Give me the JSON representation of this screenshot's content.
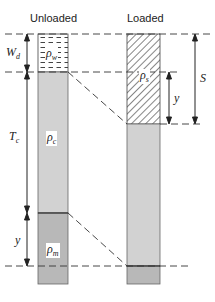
{
  "diagram": {
    "type": "isostasy-column-comparison",
    "columns": [
      {
        "title": "Unloaded",
        "layers": [
          {
            "name": "water",
            "density_label": "ρ",
            "density_sub": "w",
            "fill": "dashed-water"
          },
          {
            "name": "crust",
            "density_label": "ρ",
            "density_sub": "c",
            "fill": "#d2d2d2"
          },
          {
            "name": "mantle",
            "density_label": "ρ",
            "density_sub": "m",
            "fill": "#b8b8b8"
          }
        ]
      },
      {
        "title": "Loaded",
        "layers": [
          {
            "name": "sediment",
            "density_label": "ρ",
            "density_sub": "s",
            "fill": "hatched"
          },
          {
            "name": "crust",
            "fill": "#d2d2d2"
          },
          {
            "name": "mantle",
            "fill": "#b8b8b8"
          }
        ]
      }
    ],
    "dimensions": {
      "water_depth": {
        "symbol": "W",
        "sub": "d"
      },
      "crust_thickness": {
        "symbol": "T",
        "sub": "c"
      },
      "deflection_left": {
        "symbol": "y"
      },
      "deflection_right": {
        "symbol": "y"
      },
      "sediment_thickness": {
        "symbol": "S"
      }
    },
    "colors": {
      "crust": "#d2d2d2",
      "mantle": "#b8b8b8",
      "line": "#333333"
    }
  }
}
